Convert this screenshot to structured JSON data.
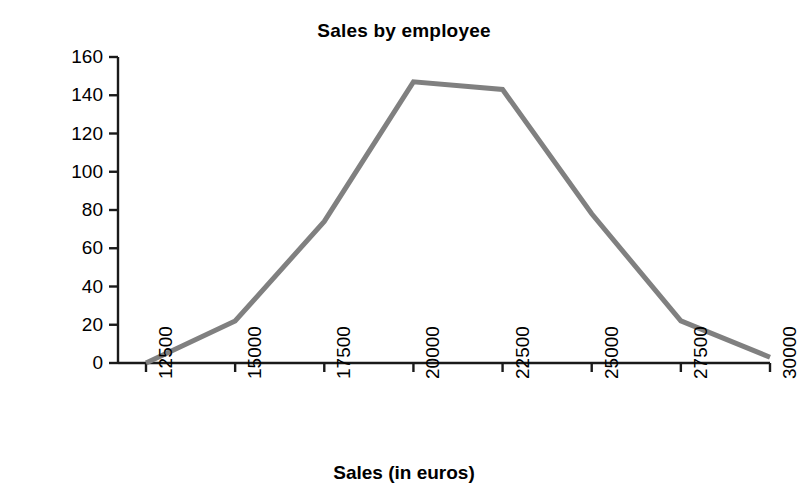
{
  "chart_data": {
    "type": "line",
    "title": "Sales by employee",
    "xlabel": "Sales (in euros)",
    "ylabel": "Frequency",
    "x": [
      12500,
      15000,
      17500,
      20000,
      22500,
      25000,
      27500,
      30000
    ],
    "categories": [
      "12500",
      "15000",
      "17500",
      "20000",
      "22500",
      "25000",
      "27500",
      "30000"
    ],
    "values": [
      0,
      22,
      74,
      147,
      143,
      78,
      22,
      3
    ],
    "series": [
      {
        "name": "Frequency",
        "values": [
          0,
          22,
          74,
          147,
          143,
          78,
          22,
          3
        ],
        "color": "#808080"
      }
    ],
    "xlim": [
      12500,
      30000
    ],
    "ylim": [
      0,
      160
    ],
    "yticks": [
      0,
      20,
      40,
      60,
      80,
      100,
      120,
      140,
      160
    ],
    "ytick_labels": [
      "0",
      "20",
      "40",
      "60",
      "80",
      "100",
      "120",
      "140",
      "160"
    ],
    "xtick_labels": [
      "12500",
      "15000",
      "17500",
      "20000",
      "22500",
      "25000",
      "27500",
      "30000"
    ],
    "grid": false,
    "legend": null,
    "line_color": "#808080",
    "line_width": 5,
    "axis_color": "#1a1a1a",
    "background": "#ffffff",
    "xtick_rotation": -90
  }
}
